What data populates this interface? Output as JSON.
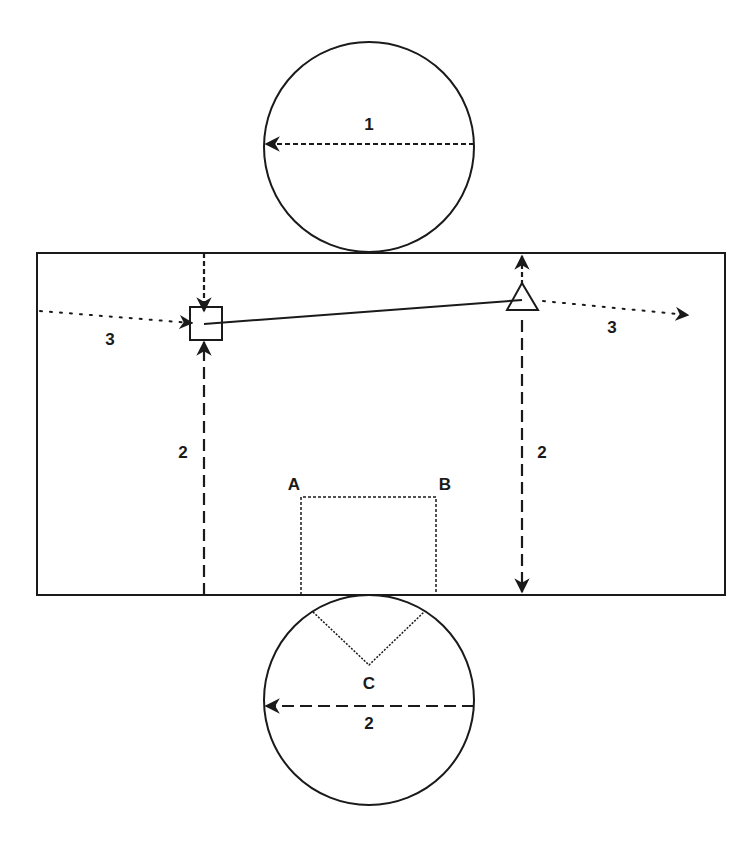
{
  "diagram": {
    "colors": {
      "ink": "#1a1a1a",
      "background": "#ffffff"
    },
    "top_circle": {
      "label": "1",
      "arrow_style": "short-dash"
    },
    "bottom_circle": {
      "diameter_label": "2",
      "vertex_label": "C",
      "arrow_style": "long-dash"
    },
    "rectangle": {
      "left_height_label": "2",
      "right_height_label": "2",
      "left_path_label": "3",
      "right_path_label": "3",
      "inner_box": {
        "corner_left_label": "A",
        "corner_right_label": "B"
      },
      "markers": [
        {
          "shape": "square",
          "position": "left"
        },
        {
          "shape": "triangle",
          "position": "right"
        }
      ]
    }
  }
}
